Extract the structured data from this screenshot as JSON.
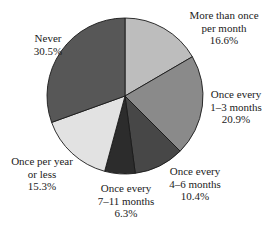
{
  "chart_data": {
    "type": "pie",
    "title": "",
    "start_angle_deg": 0,
    "direction": "clockwise",
    "center": [
      125,
      96
    ],
    "radius": 78,
    "slices": [
      {
        "lines": [
          "More than once",
          "per month"
        ],
        "value": 16.6,
        "value_label": "16.6%",
        "color": "#bdbdbd"
      },
      {
        "lines": [
          "Once every",
          "1–3 months"
        ],
        "value": 20.9,
        "value_label": "20.9%",
        "color": "#8a8a8a"
      },
      {
        "lines": [
          "Once every",
          "4–6 months"
        ],
        "value": 10.4,
        "value_label": "10.4%",
        "color": "#474747"
      },
      {
        "lines": [
          "Once every",
          "7–11 months"
        ],
        "value": 6.3,
        "value_label": "6.3%",
        "color": "#2c2c2c"
      },
      {
        "lines": [
          "Once per year",
          "or less"
        ],
        "value": 15.3,
        "value_label": "15.3%",
        "color": "#e2e2e2"
      },
      {
        "lines": [
          "Never"
        ],
        "value": 30.5,
        "value_label": "30.5%",
        "color": "#575757"
      }
    ],
    "categories": [
      "More than once per month",
      "Once every 1–3 months",
      "Once every 4–6 months",
      "Once every 7–11 months",
      "Once per year or less",
      "Never"
    ],
    "values": [
      16.6,
      20.9,
      10.4,
      6.3,
      15.3,
      30.5
    ]
  },
  "labels": {
    "more_than_once": {
      "l1": "More than once",
      "l2": "per month",
      "pct": "16.6%"
    },
    "one_three": {
      "l1": "Once every",
      "l2": "1–3 months",
      "pct": "20.9%"
    },
    "four_six": {
      "l1": "Once every",
      "l2": "4–6 months",
      "pct": "10.4%"
    },
    "seven_eleven": {
      "l1": "Once every",
      "l2": "7–11 months",
      "pct": "6.3%"
    },
    "once_year": {
      "l1": "Once per year",
      "l2": "or less",
      "pct": "15.3%"
    },
    "never": {
      "l1": "Never",
      "pct": "30.5%"
    }
  }
}
